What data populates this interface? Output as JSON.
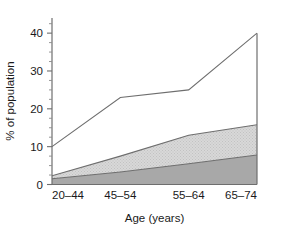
{
  "chart_data": {
    "type": "area",
    "title": "",
    "subtitle": "",
    "xlabel": "Age (years)",
    "ylabel": "% of population",
    "categories": [
      "20–44",
      "45–54",
      "55–64",
      "65–74"
    ],
    "ylim": [
      0,
      44
    ],
    "xlim": [
      0,
      3
    ],
    "grid": false,
    "legend": "none",
    "yticks": [
      0,
      10,
      20,
      30,
      40
    ],
    "ytick_labels": [
      "0",
      "10",
      "20",
      "30",
      "40"
    ],
    "yticks_minor": [
      2.5,
      5,
      7.5,
      12.5,
      15,
      17.5,
      22.5,
      25,
      27.5,
      32.5,
      35,
      37.5,
      42.5
    ],
    "stacked": true,
    "series": [
      {
        "name": "bottom-band",
        "fill": "#a8a8a8",
        "pattern": "solid",
        "values": [
          1.5,
          3.3,
          5.5,
          7.8
        ]
      },
      {
        "name": "middle-band",
        "fill": "#d2d2d2",
        "pattern": "fine-hatch",
        "values": [
          2.3,
          7.5,
          13.0,
          15.8
        ]
      },
      {
        "name": "top-band",
        "fill": "#ffffff",
        "pattern": "none",
        "values": [
          10.0,
          23.0,
          25.0,
          40.0
        ]
      }
    ],
    "colors": {
      "bottom_band": "#a8a8a8",
      "middle_band": "#d2d2d2",
      "top_band": "#ffffff",
      "line": "#6e6e6e",
      "axis": "#6e6e6e",
      "text": "#1a1a1a",
      "background": "#ffffff"
    }
  }
}
